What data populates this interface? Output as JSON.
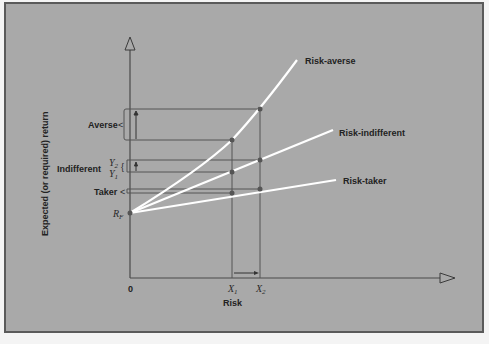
{
  "figure": {
    "background": "#a9a9a9",
    "frame_color": "#5a5a5a",
    "axis_color": "#4a4a4a",
    "curve_color": "#ffffff",
    "point_color": "#555555"
  },
  "axes": {
    "y_label": "Expected (or required) return",
    "x_label": "Risk",
    "origin_label": "0",
    "rf_label": "R",
    "rf_sub": "F",
    "x1_label": "X",
    "x1_sub": "1",
    "x2_label": "X",
    "x2_sub": "2"
  },
  "brackets": {
    "averse": "Averse",
    "indifferent": "Indifferent",
    "y2_label": "Y",
    "y2_sub": "2",
    "y1_label": "Y",
    "y1_sub": "1",
    "taker": "Taker"
  },
  "curves": [
    {
      "name": "Risk-averse",
      "label": "Risk-averse"
    },
    {
      "name": "Risk-indifferent",
      "label": "Risk-indifferent"
    },
    {
      "name": "Risk-taker",
      "label": "Risk-taker"
    }
  ]
}
